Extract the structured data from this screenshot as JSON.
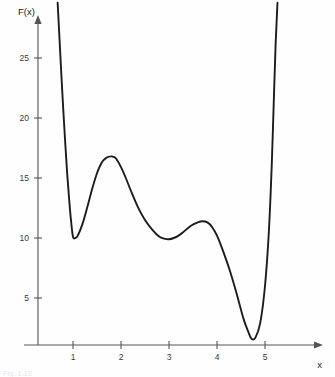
{
  "figure": {
    "background_color": "#fefefe",
    "curve_color": "#1c1c1c",
    "axis_color": "#555555",
    "caption": "Fig. 1.12"
  },
  "chart_data": {
    "type": "line",
    "title": "",
    "xlabel": "x",
    "ylabel": "F(x)",
    "xlim": [
      0.0,
      5.75
    ],
    "ylim": [
      0.0,
      30.0
    ],
    "grid": false,
    "legend": null,
    "x_ticks": [
      1,
      2,
      3,
      4,
      5
    ],
    "x_tick_labels": [
      "1",
      "2",
      "3",
      "4",
      "5"
    ],
    "y_ticks": [
      5,
      10,
      15,
      20,
      25
    ],
    "y_tick_labels": [
      "5",
      "10",
      "15",
      "20",
      "25"
    ],
    "series": [
      {
        "name": "F(x)",
        "x": [
          0.68,
          0.72,
          0.76,
          0.8,
          0.84,
          0.88,
          0.92,
          0.96,
          1.0,
          1.05,
          1.1,
          1.2,
          1.3,
          1.4,
          1.5,
          1.6,
          1.7,
          1.8,
          1.85,
          1.9,
          2.0,
          2.1,
          2.2,
          2.35,
          2.5,
          2.65,
          2.8,
          2.9,
          3.0,
          3.1,
          3.2,
          3.3,
          3.45,
          3.6,
          3.7,
          3.8,
          3.9,
          4.0,
          4.1,
          4.25,
          4.4,
          4.55,
          4.65,
          4.72,
          4.8,
          4.9,
          5.0,
          5.08,
          5.14,
          5.18,
          5.22,
          5.26
        ],
        "y": [
          29.6,
          26.5,
          23.4,
          20.5,
          17.8,
          15.3,
          13.2,
          11.4,
          10.1,
          10.0,
          10.2,
          11.2,
          12.6,
          14.1,
          15.4,
          16.3,
          16.7,
          16.8,
          16.75,
          16.6,
          15.9,
          15.0,
          14.0,
          12.6,
          11.5,
          10.7,
          10.1,
          9.95,
          9.9,
          10.0,
          10.2,
          10.5,
          11.0,
          11.3,
          11.4,
          11.3,
          10.9,
          10.2,
          9.2,
          7.5,
          5.5,
          3.3,
          2.2,
          1.6,
          1.7,
          2.9,
          6.0,
          10.5,
          16.0,
          21.0,
          26.0,
          29.6
        ]
      }
    ],
    "annotations": {
      "local_minimum_1": {
        "x": 1.02,
        "y": 10.0
      },
      "local_maximum_1": {
        "x": 1.84,
        "y": 16.8
      },
      "local_minimum_2": {
        "x": 3.02,
        "y": 9.9
      },
      "local_maximum_2": {
        "x": 3.7,
        "y": 11.4
      },
      "global_minimum": {
        "x": 4.72,
        "y": 1.55
      }
    }
  }
}
